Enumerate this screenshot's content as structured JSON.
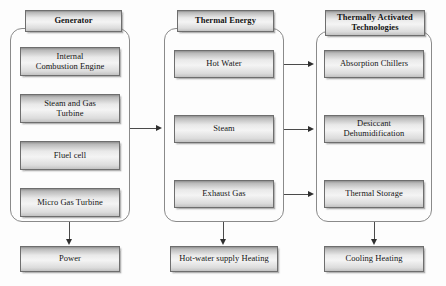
{
  "diagram": {
    "background_color": "#fdfdfd",
    "box_border_color": "#6e6e6e",
    "connector_color": "#4a4a4a",
    "columns": [
      {
        "id": "generator",
        "header": "Generator",
        "items": [
          {
            "label_line1": "Internal",
            "label_line2": "Combustion Engine"
          },
          {
            "label_line1": "Steam and Gas",
            "label_line2": "Turbine"
          },
          {
            "label_line1": "Fluel cell",
            "label_line2": ""
          },
          {
            "label_line1": "Micro Gas Turbine",
            "label_line2": ""
          }
        ],
        "output": "Power"
      },
      {
        "id": "thermal-energy",
        "header": "Thermal Energy",
        "items": [
          {
            "label_line1": "Hot Water",
            "label_line2": ""
          },
          {
            "label_line1": "Steam",
            "label_line2": ""
          },
          {
            "label_line1": "Exhaust Gas",
            "label_line2": ""
          }
        ],
        "output": "Hot-water supply Heating"
      },
      {
        "id": "thermally-activated-technologies",
        "header_line1": "Thermally Activated",
        "header_line2": "Technologies",
        "items": [
          {
            "label_line1": "Absorption Chillers",
            "label_line2": ""
          },
          {
            "label_line1": "Desiccant",
            "label_line2": "Dehumidification"
          },
          {
            "label_line1": "Thermal Storage",
            "label_line2": ""
          }
        ],
        "output": "Cooling Heating"
      }
    ]
  }
}
